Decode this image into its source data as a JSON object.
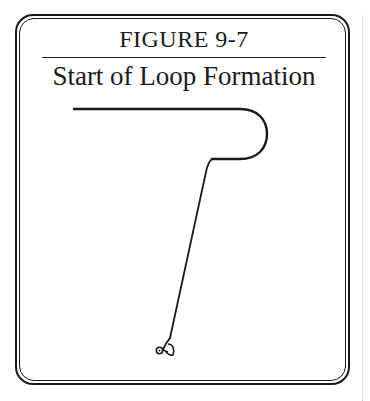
{
  "figure": {
    "label": "FIGURE 9-7",
    "title": "Start of Loop Formation"
  },
  "diagram": {
    "elements": [
      {
        "name": "horizontal-line",
        "from": [
          74,
          109
        ],
        "to": [
          245,
          109
        ]
      },
      {
        "name": "loop-curve",
        "right_extent_x": 267,
        "top_y": 109,
        "bottom_y": 159
      },
      {
        "name": "loop-bottom-segment",
        "from": [
          245,
          159
        ],
        "to": [
          212,
          159
        ]
      },
      {
        "name": "descending-line",
        "from": [
          212,
          159
        ],
        "to": [
          170,
          338
        ]
      },
      {
        "name": "tag-end-knot",
        "center": [
          160,
          350
        ]
      }
    ],
    "stroke_color": "#1a1a1a"
  },
  "colors": {
    "ink": "#1a1a1a",
    "background": "#ffffff",
    "margin_dots": "#c8c8c8"
  }
}
